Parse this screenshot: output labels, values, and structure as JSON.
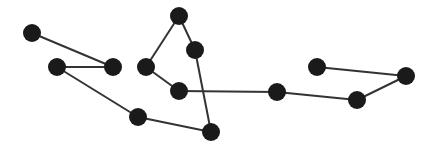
{
  "diagram": {
    "type": "graph",
    "width": 436,
    "height": 155,
    "background": "#ffffff",
    "node_color": "#1a1a1a",
    "edge_color": "#333333",
    "node_radius": 9,
    "edge_width": 2,
    "nodes": [
      {
        "id": "n1",
        "x": 32,
        "y": 33
      },
      {
        "id": "n2",
        "x": 57,
        "y": 67
      },
      {
        "id": "n3",
        "x": 113,
        "y": 67
      },
      {
        "id": "n4",
        "x": 138,
        "y": 117
      },
      {
        "id": "n5",
        "x": 211,
        "y": 132
      },
      {
        "id": "n6",
        "x": 195,
        "y": 50
      },
      {
        "id": "n7",
        "x": 179,
        "y": 16
      },
      {
        "id": "n8",
        "x": 146,
        "y": 67
      },
      {
        "id": "n9",
        "x": 179,
        "y": 91
      },
      {
        "id": "n10",
        "x": 277,
        "y": 92
      },
      {
        "id": "n11",
        "x": 357,
        "y": 100
      },
      {
        "id": "n12",
        "x": 406,
        "y": 76
      },
      {
        "id": "n13",
        "x": 317,
        "y": 67
      }
    ],
    "edges": [
      [
        "n1",
        "n3"
      ],
      [
        "n2",
        "n3"
      ],
      [
        "n2",
        "n4"
      ],
      [
        "n4",
        "n5"
      ],
      [
        "n5",
        "n6"
      ],
      [
        "n6",
        "n7"
      ],
      [
        "n7",
        "n8"
      ],
      [
        "n8",
        "n9"
      ],
      [
        "n9",
        "n10"
      ],
      [
        "n10",
        "n11"
      ],
      [
        "n11",
        "n12"
      ],
      [
        "n12",
        "n13"
      ]
    ]
  }
}
